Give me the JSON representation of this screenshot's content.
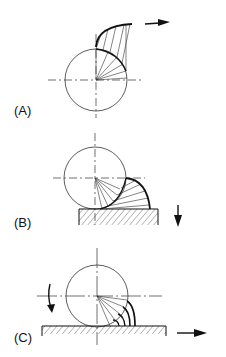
{
  "panels": [
    {
      "label": "(A)",
      "description": "Rolling circle with involute-like curve, arrow pointing right"
    },
    {
      "label": "(B)",
      "description": "Circle on hatched surface, curve reaching surface, arrow pointing down"
    },
    {
      "label": "(C)",
      "description": "Circle on hatched surface with nested curves, rotation arrow and arrow pointing right"
    }
  ],
  "colors": {
    "line": "#111111",
    "background": "#ffffff"
  }
}
